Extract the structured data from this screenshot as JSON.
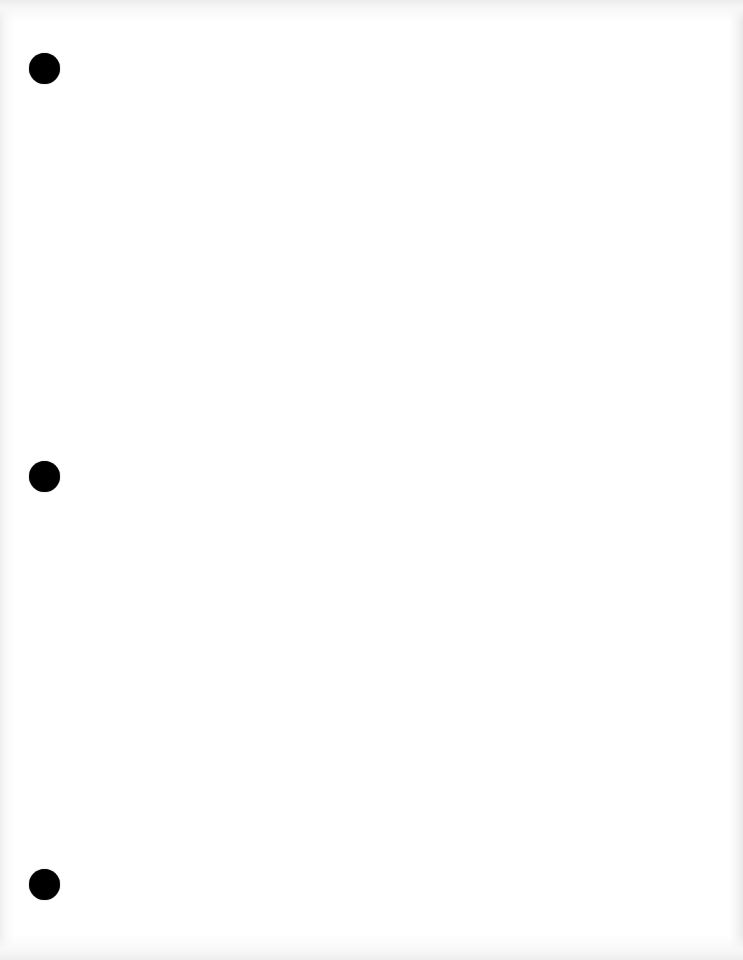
{
  "page": {
    "type": "blank-scanned-page",
    "background_color": "#ffffff",
    "edge_shade_color": "#ececec",
    "text_content": ""
  },
  "punch_holes": [
    {
      "cx": 44,
      "cy": 68,
      "diameter": 31,
      "color": "#000000"
    },
    {
      "cx": 44,
      "cy": 476,
      "diameter": 31,
      "color": "#000000"
    },
    {
      "cx": 44,
      "cy": 884,
      "diameter": 31,
      "color": "#000000"
    }
  ]
}
